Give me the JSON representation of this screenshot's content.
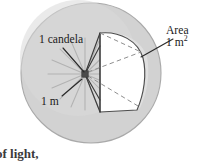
{
  "figure": {
    "kind": "diagram",
    "sphere": {
      "fill_color": "#d2d2d2",
      "edge_color": "#a8a8a8",
      "center_x": 91,
      "center_y": 73,
      "radius": 70
    },
    "source_point": {
      "label": "point light source",
      "color": "#4a4a4a",
      "x": 85,
      "y": 74
    },
    "patch": {
      "label": "unit area patch on sphere",
      "fill_color": "#ffffff",
      "edge_color": "#4a4a4a"
    },
    "rays": {
      "color": "#b0b0b0",
      "count": 16
    },
    "cone_edges": {
      "color": "#3c3c3c"
    },
    "dashed_diagonals": {
      "color": "#8c8c8c",
      "style": "dashed"
    },
    "leader_lines": {
      "color": "#2a2a2a"
    }
  },
  "labels": {
    "candela": "1 candela",
    "distance": "1 m",
    "area_title": "Area",
    "area_value": "1 m",
    "area_value_exponent": "2",
    "caption_fragment": "of light,"
  }
}
